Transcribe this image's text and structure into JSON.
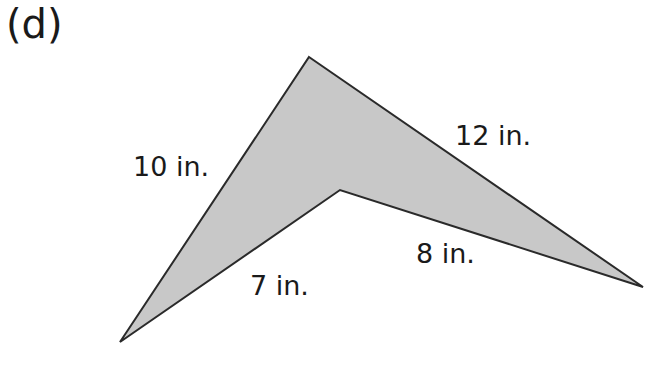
{
  "part_label": "(d)",
  "figure": {
    "shape": "concave quadrilateral (arrowhead / dart)",
    "fill_color": "#c8c8c8",
    "stroke_color": "#2a2a2a",
    "vertices": {
      "top": [
        309,
        57
      ],
      "right": [
        643,
        287
      ],
      "inner": [
        340,
        190
      ],
      "bottom_left": [
        120,
        342
      ]
    },
    "sides": [
      {
        "id": "top-left",
        "label": "10 in."
      },
      {
        "id": "top-right",
        "label": "12 in."
      },
      {
        "id": "inner-right",
        "label": "8 in."
      },
      {
        "id": "inner-left",
        "label": "7 in."
      }
    ]
  }
}
